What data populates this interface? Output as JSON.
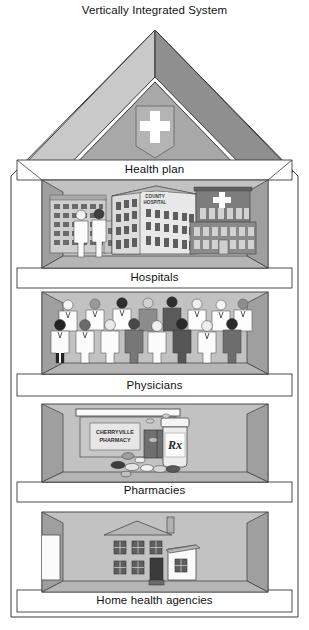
{
  "title": "Vertically Integrated System",
  "diagram": {
    "type": "house-hierarchy",
    "shape_name": "house-with-five-levels",
    "roof": {
      "emblem": "medical-cross-icon",
      "emblem_color": "#ffffff"
    }
  },
  "floors": [
    {
      "id": "health-plan",
      "label": "Health plan",
      "position": "roof-gable",
      "contents": [
        "medical cross emblem"
      ]
    },
    {
      "id": "hospitals",
      "label": "Hospitals",
      "position": "level-1",
      "contents": [
        "multi-story hospital block (left)",
        "COUNTY HOSPITAL building (center)",
        "hospital with cross sign (right)",
        "two staff figures"
      ],
      "signs": [
        {
          "name": "county-hospital-sign",
          "line1": "COUNTY",
          "line2": "HOSPITAL"
        }
      ]
    },
    {
      "id": "physicians",
      "label": "Physicians",
      "position": "level-2",
      "contents": [
        "crowd of physician figures in white coats with stethoscopes"
      ],
      "figure_count": 16
    },
    {
      "id": "pharmacies",
      "label": "Pharmacies",
      "position": "level-3",
      "contents": [
        "storefront awning",
        "CHERRYVILLE PHARMACY window sign",
        "prescription pill bottle with Rx label",
        "scattered pills and capsules"
      ],
      "signs": [
        {
          "name": "pharmacy-window-sign",
          "line1": "CHERRYVILLE",
          "line2": "PHARMACY"
        },
        {
          "name": "rx-bottle-label",
          "text": "Rx"
        }
      ]
    },
    {
      "id": "home-health-agencies",
      "label": "Home health agencies",
      "position": "level-4",
      "contents": [
        "two-story house with chimney, windows, door and side wing"
      ]
    }
  ],
  "colors": {
    "outline": "#3a3a3a",
    "paper": "#ffffff",
    "roof_light": "#c9c9c9",
    "roof_dark": "#8f8f8f",
    "gable": "#a8a8a8",
    "room_back": "#c2c2c2",
    "room_side": "#9f9f9f",
    "room_floor": "#b5b5b5",
    "band": "#ffffff",
    "dark_gray": "#6e6e6e",
    "mid_gray": "#a0a0a0"
  }
}
